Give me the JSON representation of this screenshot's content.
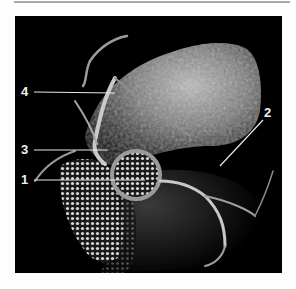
{
  "figure": {
    "colors": {
      "background": "#fdfdfd",
      "panel": "#000000",
      "annotation": "#f2f2f2",
      "rule": "#a9a9a9"
    },
    "labels": [
      {
        "id": "4",
        "text": "4"
      },
      {
        "id": "3",
        "text": "3"
      },
      {
        "id": "1",
        "text": "1"
      },
      {
        "id": "2",
        "text": "2"
      }
    ]
  }
}
